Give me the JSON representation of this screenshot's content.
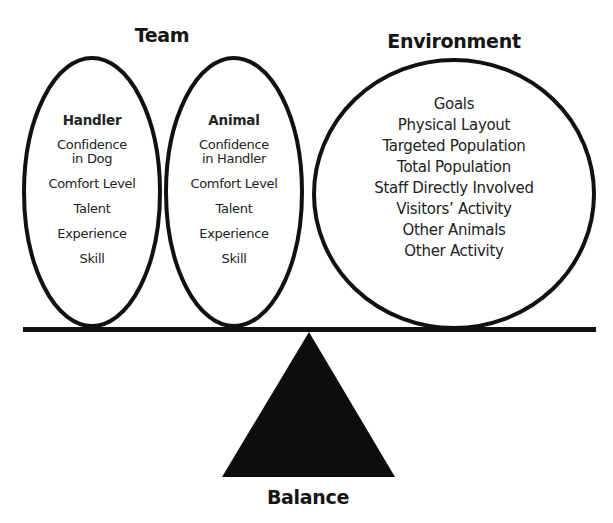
{
  "headings": {
    "team": "Team",
    "environment": "Environment",
    "balance": "Balance"
  },
  "team": {
    "handler": {
      "title": "Handler",
      "items": [
        "Confidence\nin Dog",
        "Comfort Level",
        "Talent",
        "Experience",
        "Skill"
      ]
    },
    "animal": {
      "title": "Animal",
      "items": [
        "Confidence\nin Handler",
        "Comfort Level",
        "Talent",
        "Experience",
        "Skill"
      ]
    }
  },
  "environment": {
    "items": [
      "Goals",
      "Physical Layout",
      "Targeted Population",
      "Total Population",
      "Staff Directly Involved",
      "Visitors’ Activity",
      "Other Animals",
      "Other Activity"
    ]
  },
  "colors": {
    "stroke": "#111111",
    "fulcrum": "#0d0d0d",
    "background": "#ffffff"
  }
}
